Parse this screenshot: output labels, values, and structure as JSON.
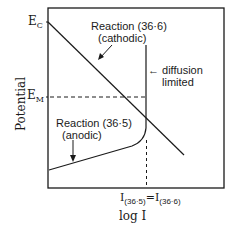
{
  "diagram": {
    "type": "evans-polarization-diagram",
    "y_axis_label": "Potential",
    "x_axis_label": "log I",
    "y_ticks": {
      "ec": {
        "main": "E",
        "sub": "C"
      },
      "em": {
        "main": "E",
        "sub": "M"
      }
    },
    "x_tick": {
      "left_main": "I",
      "left_sub": "(36·5)",
      "equals": "=",
      "right_main": "I",
      "right_sub": "(36·6)"
    },
    "annotations": {
      "cathodic_line1": "Reaction (36·6)",
      "cathodic_line2": "(cathodic)",
      "anodic_line1": "Reaction (36·5)",
      "anodic_line2": "(anodic)",
      "diffusion_line1": "← diffusion",
      "diffusion_line2": "limited"
    },
    "colors": {
      "line": "#1a1a1a",
      "background": "#ffffff"
    }
  }
}
